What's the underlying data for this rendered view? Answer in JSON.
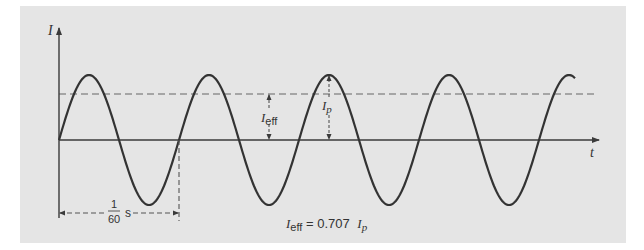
{
  "figure": {
    "type": "ac-current-waveform",
    "y_axis_label": "I",
    "x_axis_label": "t",
    "effective_label_main": "I",
    "effective_label_sub": "eff",
    "peak_label_main": "I",
    "peak_label_sub": "p",
    "period_numerator": "1",
    "period_denominator": "60",
    "period_unit": "s",
    "equation_lhs_main": "I",
    "equation_lhs_sub": "eff",
    "equation_middle": " = 0.707 ",
    "equation_rhs_main": "I",
    "equation_rhs_sub": "p"
  },
  "colors": {
    "panel": "#e5e5e5",
    "curve": "#333333",
    "axis": "#3a3a3a",
    "dashed": "#666666"
  },
  "geometry": {
    "origin_x": 59,
    "origin_y": 140,
    "amplitude_px": 65,
    "period_px": 120,
    "cycles": 4.3,
    "effective_ratio": 0.707
  }
}
